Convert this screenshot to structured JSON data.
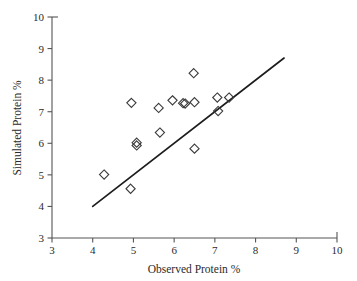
{
  "chart_data": {
    "type": "scatter",
    "title": "",
    "subtitle": "",
    "xlabel": "Observed Protein %",
    "ylabel": "Simulated Protein %",
    "xlim": [
      3,
      10
    ],
    "ylim": [
      3,
      10
    ],
    "xticks": [
      3,
      4,
      5,
      6,
      7,
      8,
      9,
      10
    ],
    "xticklabels": [
      "3",
      "4",
      "5",
      "6",
      "7",
      "8",
      "9",
      "10"
    ],
    "yticks": [
      3,
      4,
      5,
      6,
      7,
      8,
      9,
      10
    ],
    "yticklabels": [
      "3",
      "4",
      "5",
      "6",
      "7",
      "8",
      "9",
      "10"
    ],
    "grid": false,
    "legend": null,
    "marker_style": "open-diamond",
    "marker_color": "#3a3a3a",
    "points": [
      {
        "x": 4.28,
        "y": 5.01
      },
      {
        "x": 4.93,
        "y": 4.56
      },
      {
        "x": 4.95,
        "y": 7.28
      },
      {
        "x": 5.08,
        "y": 6.02
      },
      {
        "x": 5.08,
        "y": 5.93
      },
      {
        "x": 5.62,
        "y": 7.12
      },
      {
        "x": 5.65,
        "y": 6.34
      },
      {
        "x": 5.96,
        "y": 7.36
      },
      {
        "x": 6.22,
        "y": 7.27
      },
      {
        "x": 6.27,
        "y": 7.26
      },
      {
        "x": 6.48,
        "y": 8.22
      },
      {
        "x": 6.5,
        "y": 7.3
      },
      {
        "x": 6.5,
        "y": 5.83
      },
      {
        "x": 7.06,
        "y": 7.45
      },
      {
        "x": 7.08,
        "y": 7.02
      },
      {
        "x": 7.35,
        "y": 7.45
      }
    ],
    "reference_line": {
      "label": "",
      "x_start": 4.0,
      "y_start": 4.0,
      "x_end": 8.7,
      "y_end": 8.7,
      "color": "#1d1d1d"
    }
  },
  "colors": {
    "background": "#ffffff",
    "axis": "#555555",
    "text": "#2b2b2b",
    "marker": "#3a3a3a",
    "line": "#1d1d1d"
  }
}
